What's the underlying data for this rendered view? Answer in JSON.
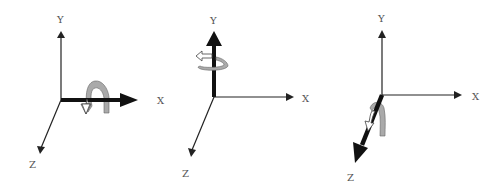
{
  "figure": {
    "colors": {
      "thin_axis": "#222222",
      "bold_axis": "#111111",
      "rotation_arrow_fill_light": "#ffffff",
      "rotation_arrow_fill_dark": "#aaaaaa",
      "label": "#555555"
    },
    "panels": [
      {
        "name": "rotation-about-x",
        "highlighted_axis": "X",
        "labels": {
          "y": "Y",
          "x": "X",
          "z": "Z"
        }
      },
      {
        "name": "rotation-about-y",
        "highlighted_axis": "Y",
        "labels": {
          "y": "Y",
          "x": "X",
          "z": "Z"
        }
      },
      {
        "name": "rotation-about-z",
        "highlighted_axis": "Z",
        "labels": {
          "y": "Y",
          "x": "X",
          "z": "Z"
        }
      }
    ]
  }
}
